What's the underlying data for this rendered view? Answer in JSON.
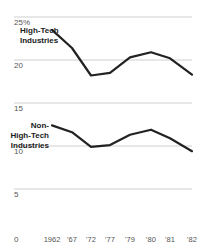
{
  "chart_data": {
    "type": "line",
    "title": "",
    "xlabel": "",
    "ylabel": "",
    "ylim": [
      0,
      25
    ],
    "yticks": [
      0,
      5,
      10,
      15,
      20,
      25
    ],
    "ytick_labels": [
      "0",
      "5",
      "10",
      "15",
      "20",
      "25%"
    ],
    "grid": true,
    "legend_position": "inline-left",
    "categories": [
      "1962",
      "'67",
      "'72",
      "'77",
      "'79",
      "'80",
      "'81",
      "'82"
    ],
    "series": [
      {
        "name": "High-Tech Industries",
        "label_lines": [
          "High-Tech",
          "Industries"
        ],
        "values": [
          23.5,
          21.4,
          18.2,
          18.5,
          20.3,
          20.9,
          20.2,
          18.3
        ]
      },
      {
        "name": "Non-High-Tech Industries",
        "label_lines": [
          "Non-",
          "High-Tech",
          "Industries"
        ],
        "values": [
          12.4,
          11.6,
          9.9,
          10.1,
          11.3,
          11.9,
          10.9,
          9.4
        ]
      }
    ]
  },
  "colors": {
    "line": "#222222",
    "grid": "#cfcfcf",
    "text": "#555555",
    "background": "#ffffff"
  }
}
